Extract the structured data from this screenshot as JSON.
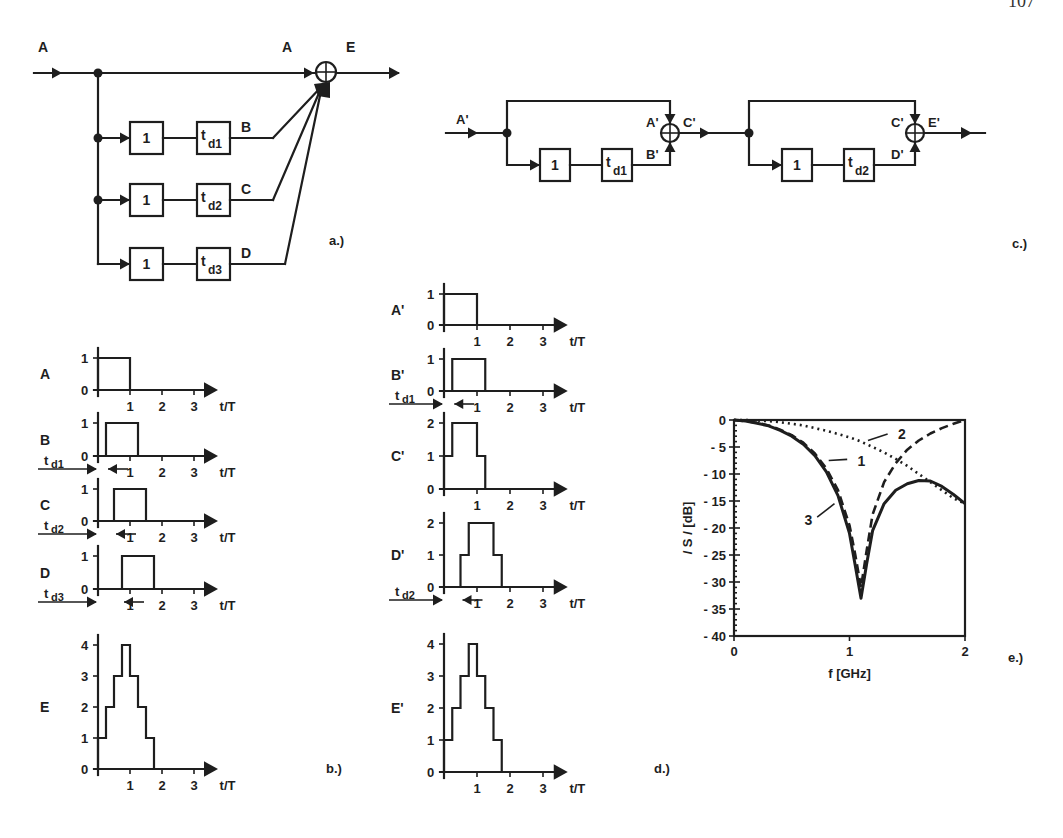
{
  "page_number": "107",
  "panels": {
    "a": {
      "caption": "a.)",
      "input_label": "A",
      "sum_input_label": "A",
      "output_label": "E",
      "branches": [
        {
          "gain": "1",
          "delay": "t",
          "delay_sub": "d1",
          "out_label": "B"
        },
        {
          "gain": "1",
          "delay": "t",
          "delay_sub": "d2",
          "out_label": "C"
        },
        {
          "gain": "1",
          "delay": "t",
          "delay_sub": "d3",
          "out_label": "D"
        }
      ]
    },
    "c": {
      "caption": "c.)",
      "stages": [
        {
          "input_label": "A'",
          "top_label": "A'",
          "bottom_label": "B'",
          "output_label": "C'",
          "gain": "1",
          "delay": "t",
          "delay_sub": "d1"
        },
        {
          "input_label": "",
          "top_label": "C'",
          "bottom_label": "D'",
          "output_label": "E'",
          "gain": "1",
          "delay": "t",
          "delay_sub": "d2"
        }
      ]
    },
    "b": {
      "caption": "b.)",
      "x_axis_label": "t/T",
      "x_ticks": [
        "1",
        "2",
        "3"
      ],
      "plots": [
        {
          "name": "A",
          "y_ticks": [
            "0",
            "1"
          ],
          "levels": [
            [
              0,
              1
            ],
            [
              1,
              0
            ]
          ],
          "delay_label": ""
        },
        {
          "name": "B",
          "y_ticks": [
            "0",
            "1"
          ],
          "levels": [
            [
              0.25,
              1
            ],
            [
              1.25,
              0
            ]
          ],
          "delay_label": "d1"
        },
        {
          "name": "C",
          "y_ticks": [
            "0",
            "1"
          ],
          "levels": [
            [
              0.5,
              1
            ],
            [
              1.5,
              0
            ]
          ],
          "delay_label": "d2"
        },
        {
          "name": "D",
          "y_ticks": [
            "0",
            "1"
          ],
          "levels": [
            [
              0.75,
              1
            ],
            [
              1.75,
              0
            ]
          ],
          "delay_label": "d3"
        },
        {
          "name": "E",
          "y_ticks": [
            "0",
            "1",
            "2",
            "3",
            "4"
          ],
          "levels": [
            [
              0,
              1
            ],
            [
              0.25,
              2
            ],
            [
              0.5,
              3
            ],
            [
              0.75,
              4
            ],
            [
              1,
              3
            ],
            [
              1.25,
              2
            ],
            [
              1.5,
              1
            ],
            [
              1.75,
              0
            ]
          ],
          "delay_label": ""
        }
      ]
    },
    "d": {
      "caption": "d.)",
      "x_axis_label": "t/T",
      "x_ticks": [
        "1",
        "2",
        "3"
      ],
      "plots": [
        {
          "name": "A'",
          "y_ticks": [
            "0",
            "1"
          ],
          "levels": [
            [
              0,
              1
            ],
            [
              1,
              0
            ]
          ],
          "delay_label": ""
        },
        {
          "name": "B'",
          "y_ticks": [
            "0",
            "1"
          ],
          "levels": [
            [
              0.25,
              1
            ],
            [
              1.25,
              0
            ]
          ],
          "delay_label": "d1"
        },
        {
          "name": "C'",
          "y_ticks": [
            "0",
            "1",
            "2"
          ],
          "levels": [
            [
              0,
              1
            ],
            [
              0.25,
              2
            ],
            [
              1,
              1
            ],
            [
              1.25,
              0
            ]
          ],
          "delay_label": ""
        },
        {
          "name": "D'",
          "y_ticks": [
            "0",
            "1",
            "2"
          ],
          "levels": [
            [
              0.5,
              1
            ],
            [
              0.75,
              2
            ],
            [
              1.5,
              1
            ],
            [
              1.75,
              0
            ]
          ],
          "delay_label": "d2"
        },
        {
          "name": "E'",
          "y_ticks": [
            "0",
            "1",
            "2",
            "3",
            "4"
          ],
          "levels": [
            [
              0,
              1
            ],
            [
              0.25,
              2
            ],
            [
              0.5,
              3
            ],
            [
              0.75,
              4
            ],
            [
              1,
              3
            ],
            [
              1.25,
              2
            ],
            [
              1.5,
              1
            ],
            [
              1.75,
              0
            ]
          ],
          "delay_label": ""
        }
      ]
    },
    "e": {
      "caption": "e.)"
    }
  },
  "chart_data": {
    "type": "line",
    "title": "",
    "xlabel": "f [GHz]",
    "ylabel": "/ S / [dB]",
    "xlim": [
      0,
      2
    ],
    "ylim": [
      -40,
      0
    ],
    "x_ticks": [
      "0",
      "1",
      "2"
    ],
    "y_ticks": [
      "0",
      "-5",
      "-10",
      "-15",
      "-20",
      "-25",
      "-30",
      "-35",
      "-40"
    ],
    "grid": false,
    "legend": "inline numbered callouts",
    "x": [
      0,
      0.1,
      0.2,
      0.3,
      0.4,
      0.5,
      0.6,
      0.7,
      0.8,
      0.9,
      1.0,
      1.05,
      1.1,
      1.15,
      1.2,
      1.3,
      1.4,
      1.5,
      1.6,
      1.7,
      1.8,
      1.9,
      2.0
    ],
    "series": [
      {
        "name": "1",
        "style": "dashed",
        "values": [
          0,
          -0.2,
          -0.5,
          -1.0,
          -1.8,
          -2.8,
          -4.2,
          -6.2,
          -9.0,
          -13.0,
          -19.5,
          -25.0,
          -31.0,
          -24.0,
          -17.5,
          -11.5,
          -8.0,
          -5.5,
          -3.8,
          -2.5,
          -1.5,
          -0.7,
          0
        ]
      },
      {
        "name": "2",
        "style": "dotted",
        "values": [
          0,
          0,
          -0.1,
          -0.2,
          -0.4,
          -0.7,
          -1.0,
          -1.5,
          -2.0,
          -2.6,
          -3.2,
          -3.6,
          -4.0,
          -4.5,
          -5.0,
          -6.0,
          -7.2,
          -8.5,
          -10.0,
          -11.5,
          -13.0,
          -14.5,
          -15.5
        ]
      },
      {
        "name": "3",
        "style": "solid",
        "values": [
          0,
          -0.2,
          -0.6,
          -1.1,
          -1.9,
          -3.0,
          -4.5,
          -6.6,
          -9.6,
          -14.0,
          -21.0,
          -27.0,
          -33.0,
          -26.5,
          -20.5,
          -15.5,
          -13.0,
          -11.8,
          -11.2,
          -11.3,
          -12.3,
          -13.8,
          -15.5
        ]
      }
    ],
    "annotations": [
      {
        "text": "1",
        "x": 1.0,
        "y": -7.5
      },
      {
        "text": "2",
        "x": 1.35,
        "y": -2.5
      },
      {
        "text": "3",
        "x": 0.68,
        "y": -18.5
      }
    ]
  }
}
